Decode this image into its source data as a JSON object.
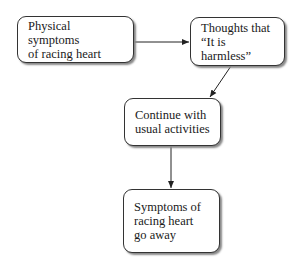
{
  "nodes": [
    {
      "id": "physical-symptoms",
      "label": "Physical symptoms\nof racing heart"
    },
    {
      "id": "thoughts-harmless",
      "label": "Thoughts that\n“It is harmless”"
    },
    {
      "id": "continue-activities",
      "label": "Continue with\nusual activities"
    },
    {
      "id": "symptoms-go-away",
      "label": "Symptoms of\nracing heart\ngo away"
    }
  ],
  "edges": [
    {
      "from": "physical-symptoms",
      "to": "thoughts-harmless"
    },
    {
      "from": "thoughts-harmless",
      "to": "continue-activities"
    },
    {
      "from": "continue-activities",
      "to": "symptoms-go-away"
    }
  ]
}
